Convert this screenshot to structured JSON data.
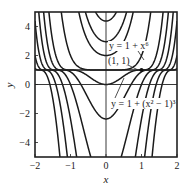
{
  "chart_data": {
    "type": "line",
    "title": "",
    "xlabel": "x",
    "ylabel": "y",
    "xlim": [
      -2,
      2
    ],
    "ylim": [
      -5,
      5
    ],
    "xticks": [
      -2,
      -1,
      0,
      1,
      2
    ],
    "yticks": [
      -4,
      -2,
      0,
      2,
      4
    ],
    "xtick_labels": [
      "−2",
      "−1",
      "0",
      "1",
      "2"
    ],
    "ytick_labels": [
      "−4",
      "−2",
      "0",
      "2",
      "4"
    ],
    "grid": false,
    "family": "y = 1 + (x^2 + C)^3",
    "series": [
      {
        "name": "C=1.5",
        "C": 1.5
      },
      {
        "name": "C=1.25",
        "C": 1.25
      },
      {
        "name": "C=1",
        "C": 1
      },
      {
        "name": "y = 1 + x^6",
        "C": 0
      },
      {
        "name": "y = 1 + (x^2 - 1)^3",
        "C": -1
      },
      {
        "name": "C=-1.5",
        "C": -1.5
      },
      {
        "name": "C=-2",
        "C": -2
      },
      {
        "name": "C=-2.5",
        "C": -2.5
      },
      {
        "name": "C=-3",
        "C": -3
      },
      {
        "name": "C=-3.5",
        "C": -3.5
      }
    ],
    "reference_lines": [
      {
        "type": "horizontal",
        "y": 1
      },
      {
        "type": "horizontal",
        "y": 0
      },
      {
        "type": "vertical",
        "x": 0
      }
    ],
    "points": [
      {
        "x": 1,
        "y": 1,
        "label": "(1, 1)"
      }
    ],
    "annotations": [
      {
        "text": "y = 1 + x⁶",
        "x": -0.05,
        "y": 2.7
      },
      {
        "text": "(1, 1)",
        "x": -0.05,
        "y": 1.55
      },
      {
        "text": "y = 1 + (x² − 1)³",
        "x": 0.0,
        "y": -1.2
      }
    ]
  },
  "labels": {
    "xlabel": "x",
    "ylabel": "y",
    "ann_x6": "y = 1 + x⁶",
    "ann_point": "(1, 1)",
    "ann_cubic": "y = 1 + (x² − 1)³"
  }
}
